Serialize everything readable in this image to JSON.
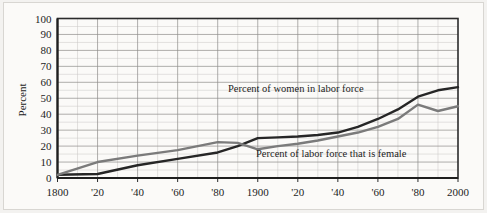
{
  "figure": {
    "y_axis_title": "Percent",
    "background_color": "#fbfaf8"
  },
  "annotations": {
    "women_label": "Percent of women in labor force",
    "female_share_label": "Percent of labor force that is female"
  },
  "chart_data": {
    "type": "line",
    "title": "",
    "xlabel": "",
    "ylabel": "Percent",
    "xlim": [
      1800,
      2000
    ],
    "ylim": [
      0,
      100
    ],
    "grid": true,
    "legend": "inline-annotations",
    "y_ticks": [
      0,
      10,
      20,
      30,
      40,
      50,
      60,
      70,
      80,
      90,
      100
    ],
    "y_tick_labels": [
      "0",
      "10",
      "20",
      "30",
      "40",
      "50",
      "60",
      "70",
      "80",
      "90",
      "100"
    ],
    "x_ticks": [
      1800,
      1820,
      1840,
      1860,
      1880,
      1900,
      1920,
      1940,
      1960,
      1980,
      2000
    ],
    "x_tick_labels": [
      "1800",
      "'20",
      "'40",
      "'60",
      "'80",
      "1900",
      "'20",
      "'40",
      "'60",
      "'80",
      "2000"
    ],
    "x_minor_step": 10,
    "y_minor_step": 10,
    "series": [
      {
        "name": "Percent of women in labor force",
        "color": "#262626",
        "width": 2.4,
        "x": [
          1800,
          1820,
          1840,
          1860,
          1880,
          1890,
          1900,
          1910,
          1920,
          1930,
          1940,
          1950,
          1960,
          1970,
          1980,
          1990,
          2000
        ],
        "values": [
          2,
          2.5,
          8,
          12,
          16,
          20,
          25,
          25.5,
          26,
          27,
          28.5,
          32,
          37,
          43,
          51,
          55,
          57
        ]
      },
      {
        "name": "Percent of labor force that is female",
        "color": "#7b7b7b",
        "width": 2.4,
        "x": [
          1800,
          1820,
          1840,
          1860,
          1880,
          1890,
          1900,
          1910,
          1920,
          1930,
          1940,
          1950,
          1960,
          1970,
          1980,
          1990,
          2000
        ],
        "values": [
          2,
          10,
          14,
          17.5,
          22.5,
          22,
          18,
          20,
          21.5,
          23.5,
          26,
          28.5,
          32,
          37,
          46,
          42,
          45
        ]
      }
    ]
  }
}
